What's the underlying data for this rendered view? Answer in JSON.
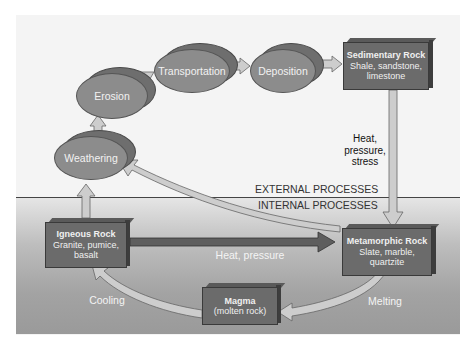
{
  "zones": {
    "external_label": "EXTERNAL PROCESSES",
    "internal_label": "INTERNAL PROCESSES"
  },
  "processes": [
    {
      "id": "weathering",
      "label": "Weathering"
    },
    {
      "id": "erosion",
      "label": "Erosion"
    },
    {
      "id": "transportation",
      "label": "Transportation"
    },
    {
      "id": "deposition",
      "label": "Deposition"
    }
  ],
  "rocks": {
    "sedimentary": {
      "title": "Sedimentary Rock",
      "examples_line1": "Shale, sandstone,",
      "examples_line2": "limestone"
    },
    "metamorphic": {
      "title": "Metamorphic Rock",
      "examples_line1": "Slate, marble,",
      "examples_line2": "quartzite"
    },
    "igneous": {
      "title": "Igneous Rock",
      "examples_line1": "Granite, pumice,",
      "examples_line2": "basalt"
    },
    "magma": {
      "title": "Magma",
      "examples_line1": "(molten rock)"
    }
  },
  "arrow_labels": {
    "sed_to_meta_line1": "Heat,",
    "sed_to_meta_line2": "pressure,",
    "sed_to_meta_line3": "stress",
    "ign_to_meta": "Heat, pressure",
    "melting": "Melting",
    "cooling": "Cooling"
  },
  "colors": {
    "ellipse_fill": "#8c8c8c",
    "box_fill": "#6b6b6b",
    "arrow_fill": "#c8c8c8",
    "dark_arrow": "#5e5e5e"
  }
}
